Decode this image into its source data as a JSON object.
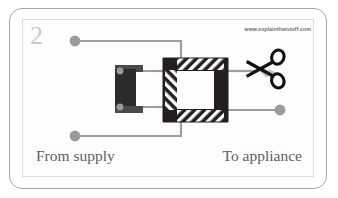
{
  "figure": {
    "step_number": "2",
    "watermark": "www.explainthatstuff.com",
    "caption_left": "From supply",
    "caption_right": "To appliance",
    "colors": {
      "card_border": "#a9a9ab",
      "inner_border": "#dedede",
      "page_background": "#ffffff",
      "panel_background": "#fdfdfd",
      "step_number": "#c9c9c9",
      "caption_text": "#5d5d62",
      "watermark_text": "#6f6f73",
      "wire": "#9e9e9e",
      "terminal_dot": "#9a9a9a",
      "core_black": "#231f20",
      "coil_black": "#2b2b2b",
      "hatch_white": "#ffffff",
      "scissors_black": "#111111",
      "scissors_blade_gray": "#b5b5b5"
    },
    "elements": {
      "supply_top_terminal": "terminal-dot",
      "supply_bottom_terminal": "terminal-dot",
      "appliance_terminal": "terminal-dot",
      "coil_block": "primary-coil-block",
      "core_ring": "laminated-iron-core-ring",
      "cut_tool": "scissors-icon"
    }
  }
}
